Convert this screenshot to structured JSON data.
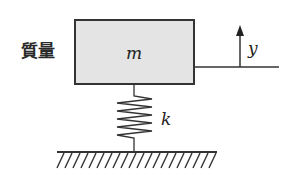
{
  "diagram": {
    "mass": {
      "side_label": "質量",
      "symbol": "m",
      "fill": "#e4e4e4",
      "stroke": "#333333"
    },
    "spring": {
      "symbol": "k"
    },
    "displacement": {
      "symbol": "y",
      "direction": "up"
    },
    "ground": {
      "type": "fixed hatched surface"
    },
    "colors": {
      "line": "#333333",
      "background": "#ffffff"
    }
  }
}
